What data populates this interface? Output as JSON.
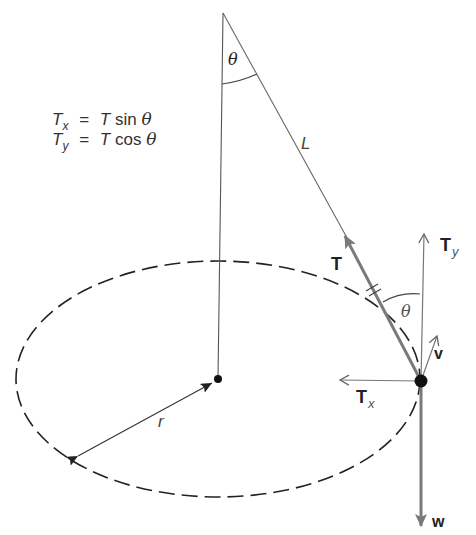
{
  "diagram": {
    "type": "conical-pendulum-free-body",
    "equations": [
      {
        "lhs": "T",
        "lhs_sub": "x",
        "eq": "=",
        "rhs_var": "T",
        "rhs_fn": "sin",
        "rhs_angle": "θ"
      },
      {
        "lhs": "T",
        "lhs_sub": "y",
        "eq": "=",
        "rhs_var": "T",
        "rhs_fn": "cos",
        "rhs_angle": "θ"
      }
    ],
    "labels": {
      "theta_top": "θ",
      "string_length": "L",
      "tension": "T",
      "tension_y": "T",
      "tension_y_sub": "y",
      "theta_bob": "θ",
      "velocity": "v",
      "tension_x": "T",
      "tension_x_sub": "x",
      "weight": "w",
      "radius": "r"
    },
    "colors": {
      "line": "#555555",
      "vector": "#777777",
      "bob": "#111111",
      "dash": "#222222"
    }
  }
}
